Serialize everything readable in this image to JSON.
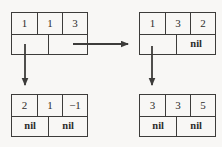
{
  "diagram": {
    "background": "#f8f7f5",
    "line_color": "#3d3c3a",
    "text_color": "#2e2d2b",
    "nodes": {
      "top_left": {
        "keys": [
          "1",
          "1",
          "3"
        ],
        "pointers": [
          "",
          ""
        ]
      },
      "top_right": {
        "keys": [
          "1",
          "3",
          "2"
        ],
        "pointers": [
          "",
          "nil"
        ]
      },
      "bottom_left": {
        "keys": [
          "2",
          "1",
          "−1"
        ],
        "pointers": [
          "nil",
          "nil"
        ]
      },
      "bottom_right": {
        "keys": [
          "3",
          "3",
          "5"
        ],
        "pointers": [
          "nil",
          "nil"
        ]
      }
    }
  }
}
